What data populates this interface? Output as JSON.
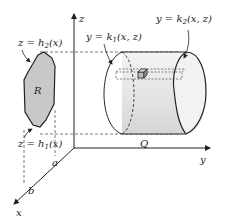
{
  "diagram": {
    "axes": {
      "z": "z",
      "y": "y",
      "x": "x"
    },
    "labels": {
      "h2": {
        "pre": "z = h",
        "sub": "2",
        "post": "(x)"
      },
      "h1": {
        "pre": "z = h",
        "sub": "1",
        "post": "(x)"
      },
      "k1": {
        "pre": "y = k",
        "sub": "1",
        "post": "(x, z)"
      },
      "k2": {
        "pre": "y = k",
        "sub": "2",
        "post": "(x, z)"
      },
      "region_R": "R",
      "region_Q": "Q",
      "a": "a",
      "b": "b"
    },
    "colors": {
      "region_fill": "#c8c8c8",
      "solid_fill": "#e6e6e6",
      "line": "#222222",
      "dash": "#555555"
    }
  }
}
